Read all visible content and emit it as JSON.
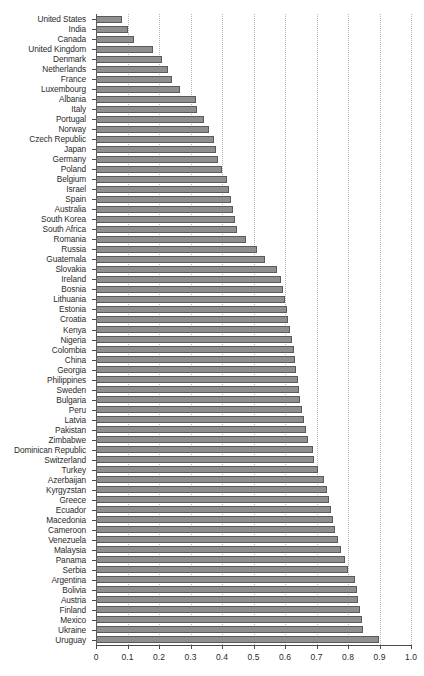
{
  "chart_data": {
    "type": "bar",
    "orientation": "horizontal",
    "title": "",
    "subtitle": "",
    "xlabel": "",
    "ylabel": "",
    "xlim": [
      0,
      1.0
    ],
    "xticks": [
      "0",
      "0.1",
      "0.2",
      "0.3",
      "0.4",
      "0.5",
      "0.6",
      "0.7",
      "0.8",
      "0.9",
      "1.0"
    ],
    "xtick_values": [
      0,
      0.1,
      0.2,
      0.3,
      0.4,
      0.5,
      0.6,
      0.7,
      0.8,
      0.9,
      1.0
    ],
    "grid": "vertical-dotted",
    "legend": "none",
    "bar_color": "#8f8f8f",
    "bar_edge_color": "#5a5a5a",
    "categories": [
      "United States",
      "India",
      "Canada",
      "United Kingdom",
      "Denmark",
      "Netherlands",
      "France",
      "Luxembourg",
      "Albania",
      "Italy",
      "Portugal",
      "Norway",
      "Czech Republic",
      "Japan",
      "Germany",
      "Poland",
      "Belgium",
      "Israel",
      "Spain",
      "Australia",
      "South Korea",
      "South Africa",
      "Romania",
      "Russia",
      "Guatemala",
      "Slovakia",
      "Ireland",
      "Bosnia",
      "Lithuania",
      "Estonia",
      "Croatia",
      "Kenya",
      "Nigeria",
      "Colombia",
      "China",
      "Georgia",
      "Philippines",
      "Sweden",
      "Bulgaria",
      "Peru",
      "Latvia",
      "Pakistan",
      "Zimbabwe",
      "Dominican Republic",
      "Switzerland",
      "Turkey",
      "Azerbaijan",
      "Kyrgyzstan",
      "Greece",
      "Ecuador",
      "Macedonia",
      "Cameroon",
      "Venezuela",
      "Malaysia",
      "Panama",
      "Serbia",
      "Argentina",
      "Bolivia",
      "Austria",
      "Finland",
      "Mexico",
      "Ukraine",
      "Uruguay"
    ],
    "values": [
      0.083,
      0.101,
      0.122,
      0.181,
      0.21,
      0.229,
      0.24,
      0.267,
      0.318,
      0.322,
      0.343,
      0.36,
      0.375,
      0.381,
      0.387,
      0.4,
      0.416,
      0.422,
      0.429,
      0.435,
      0.441,
      0.448,
      0.476,
      0.511,
      0.537,
      0.575,
      0.586,
      0.594,
      0.6,
      0.605,
      0.61,
      0.616,
      0.622,
      0.629,
      0.632,
      0.635,
      0.641,
      0.644,
      0.648,
      0.654,
      0.66,
      0.667,
      0.673,
      0.689,
      0.692,
      0.705,
      0.724,
      0.733,
      0.74,
      0.746,
      0.752,
      0.759,
      0.768,
      0.778,
      0.79,
      0.8,
      0.822,
      0.829,
      0.832,
      0.838,
      0.845,
      0.848,
      0.897
    ]
  }
}
